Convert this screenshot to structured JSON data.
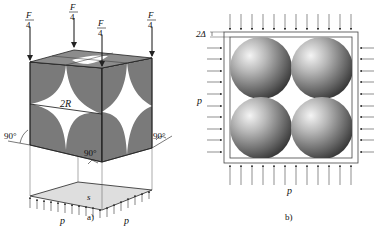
{
  "figure_a": {
    "caption": "a)",
    "force_top": "F",
    "force_bottom": "4",
    "diameter_label": "2R",
    "angle_left": "90°",
    "angle_right": "90°",
    "angle_bottom": "90°",
    "plate_label": "s",
    "pressure_left": "p",
    "pressure_right": "p"
  },
  "figure_b": {
    "caption": "b)",
    "gap_label": "2Δ",
    "pressure_left": "p",
    "pressure_bottom": "p"
  },
  "colors": {
    "cube_face": "#7a7a7a",
    "cube_top": "#8c8c8c",
    "plate": "#dedede",
    "line": "#222222",
    "sphere_light": "#f2f2f2",
    "sphere_dark": "#3a3a3a"
  }
}
